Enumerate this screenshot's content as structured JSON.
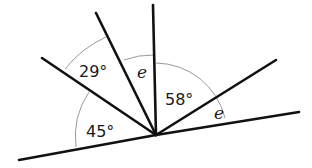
{
  "diagram": {
    "type": "angles-at-a-point-on-line",
    "vertex": [
      156,
      135
    ],
    "labels": {
      "angle_45": "45°",
      "angle_29": "29°",
      "angle_e_top": "e",
      "angle_58": "58°",
      "angle_e_right": "e"
    }
  }
}
